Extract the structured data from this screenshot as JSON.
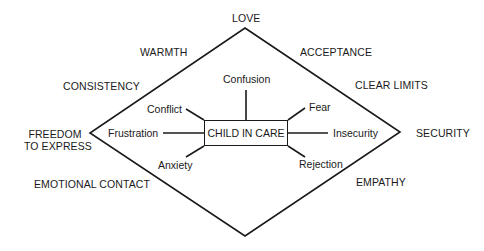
{
  "diagram": {
    "center": "CHILD IN CARE",
    "outer_needs": {
      "top": "LOVE",
      "upper_left_1": "WARMTH",
      "upper_left_2": "CONSISTENCY",
      "left_line1": "FREEDOM",
      "left_line2": "TO EXPRESS",
      "lower_left": "EMOTIONAL CONTACT",
      "upper_right_1": "ACCEPTANCE",
      "upper_right_2": "CLEAR LIMITS",
      "right": "SECURITY",
      "lower_right": "EMPATHY"
    },
    "inner_feelings": {
      "top": "Confusion",
      "upper_left": "Conflict",
      "left": "Frustration",
      "lower_left": "Anxiety",
      "upper_right": "Fear",
      "right": "Insecurity",
      "lower_right": "Rejection"
    }
  }
}
